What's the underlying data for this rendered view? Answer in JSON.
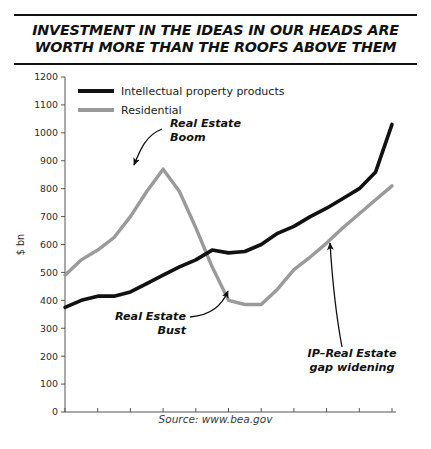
{
  "title": "INVESTMENT IN THE IDEAS IN OUR HEADS ARE\nWORTH MORE THAN THE ROOFS ABOVE THEM",
  "source": "Source: www.bea.gov",
  "colors": {
    "ip_line": "#111111",
    "residential_line": "#9a9a9a",
    "axis": "#555555",
    "text": "#1c1c1c",
    "background": "#ffffff"
  },
  "legend": {
    "position": "top-left",
    "items": [
      {
        "label": "Intellectual property products",
        "color": "#111111"
      },
      {
        "label": "Residential",
        "color": "#9a9a9a"
      }
    ]
  },
  "annotations": [
    {
      "id": "boom",
      "text": "Real Estate\nBoom",
      "lines": [
        "Real Estate",
        "Boom"
      ]
    },
    {
      "id": "bust",
      "text": "Real Estate\nBust",
      "lines": [
        "Real Estate",
        "Bust"
      ]
    },
    {
      "id": "gap",
      "text": "IP–Real Estate\ngap widening",
      "lines": [
        "IP–Real Estate",
        "gap widening"
      ]
    }
  ],
  "chart_data": {
    "type": "line",
    "title": "INVESTMENT IN THE IDEAS IN OUR HEADS ARE WORTH MORE THAN THE ROOFS ABOVE THEM",
    "subtitle": "",
    "xlabel": "",
    "ylabel": "$ bn",
    "xlim": [
      1999,
      2019
    ],
    "ylim": [
      0,
      1200
    ],
    "yticks": [
      0,
      100,
      200,
      300,
      400,
      500,
      600,
      700,
      800,
      900,
      1000,
      1100,
      1200
    ],
    "ytick_labels": [
      "0",
      "100",
      "200",
      "300",
      "400",
      "500",
      "600",
      "700",
      "800",
      "900",
      "1000",
      "1100",
      "1200"
    ],
    "xticks": [
      1999,
      2001,
      2003,
      2005,
      2007,
      2009,
      2011,
      2013,
      2015,
      2017,
      2019
    ],
    "xtick_labels": [
      "1999",
      "2001",
      "2003",
      "2005",
      "2007",
      "2009",
      "2011",
      "2013",
      "2015",
      "2017",
      "2019"
    ],
    "grid": false,
    "legend_position": "top-left",
    "x": [
      1999,
      2000,
      2001,
      2002,
      2003,
      2004,
      2005,
      2006,
      2007,
      2008,
      2009,
      2010,
      2011,
      2012,
      2013,
      2014,
      2015,
      2016,
      2017,
      2018,
      2019
    ],
    "series": [
      {
        "name": "Intellectual property products",
        "color": "#111111",
        "values": [
          375,
          400,
          415,
          415,
          430,
          460,
          490,
          520,
          545,
          580,
          570,
          575,
          600,
          640,
          665,
          700,
          730,
          765,
          800,
          860,
          1030
        ]
      },
      {
        "name": "Residential",
        "color": "#9a9a9a",
        "values": [
          490,
          545,
          580,
          625,
          700,
          790,
          870,
          790,
          660,
          520,
          400,
          385,
          385,
          440,
          510,
          555,
          605,
          660,
          710,
          760,
          810
        ]
      }
    ]
  }
}
